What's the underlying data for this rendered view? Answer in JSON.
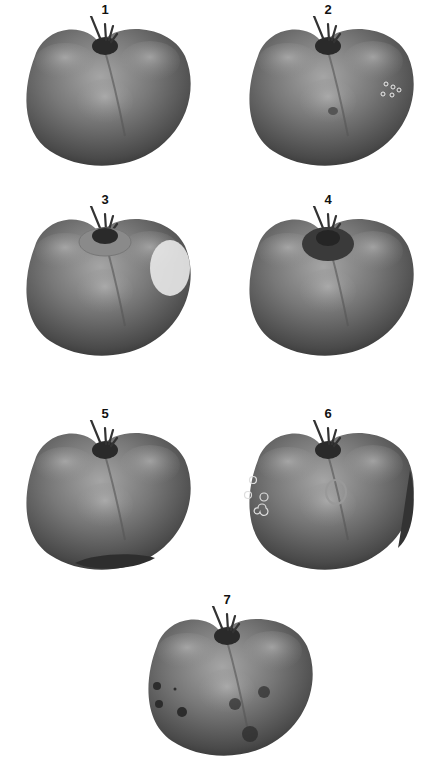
{
  "figure": {
    "panels": [
      {
        "label": "1",
        "symptom": "healthy"
      },
      {
        "label": "2",
        "symptom": "small-pin-punctures"
      },
      {
        "label": "3",
        "symptom": "shoulder-bleaching-and-collar-scar"
      },
      {
        "label": "4",
        "symptom": "dark-stem-collar"
      },
      {
        "label": "5",
        "symptom": "blossom-end-dark-patch"
      },
      {
        "label": "6",
        "symptom": "ring-spots-and-side-lesion"
      },
      {
        "label": "7",
        "symptom": "dark-spots"
      }
    ]
  },
  "colors": {
    "background": "#ffffff",
    "tomato_dark": "#3a3a3a",
    "tomato_mid": "#6e6e6e",
    "tomato_light": "#a8a8a8",
    "stem": "#2a2a2a",
    "label": "#111111"
  }
}
